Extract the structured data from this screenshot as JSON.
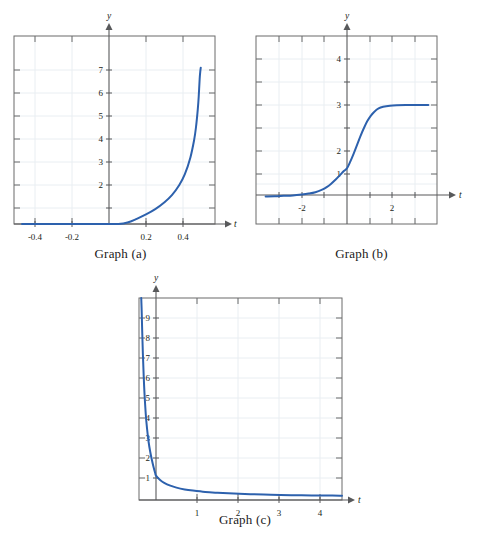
{
  "figure": {
    "title": "",
    "panels": [
      {
        "id": "a",
        "caption": "Graph (a)",
        "x_axis_name": "t",
        "y_axis_name": "y"
      },
      {
        "id": "b",
        "caption": "Graph (b)",
        "x_axis_name": "t",
        "y_axis_name": "y"
      },
      {
        "id": "c",
        "caption": "Graph (c)",
        "x_axis_name": "t",
        "y_axis_name": "y"
      }
    ]
  },
  "chart_data": [
    {
      "type": "line",
      "id": "a",
      "title": "Graph (a)",
      "xlabel": "t",
      "ylabel": "y",
      "xlim": [
        -0.47,
        0.5
      ],
      "ylim": [
        0,
        8.1
      ],
      "xticks": [
        -0.4,
        -0.2,
        0.2,
        0.4
      ],
      "xtick_labels": [
        "-0.4",
        "-0.2",
        "0.2",
        "0.4"
      ],
      "yticks": [
        2,
        3,
        4,
        5,
        6,
        7
      ],
      "ytick_labels": [
        "2",
        "3",
        "4",
        "5",
        "6",
        "7"
      ],
      "grid": true,
      "legend": "none",
      "series": [
        {
          "name": "curve-a",
          "color": "#2d61ad",
          "description": "increasing convex curve with vertical asymptote near t = 0.5",
          "x": [
            -0.47,
            -0.44,
            -0.4,
            -0.35,
            -0.3,
            -0.25,
            -0.2,
            -0.15,
            -0.1,
            -0.05,
            0.0,
            0.05,
            0.1,
            0.15,
            0.2,
            0.25,
            0.3,
            0.34,
            0.38,
            0.41,
            0.44,
            0.46,
            0.47,
            0.48,
            0.485,
            0.49,
            0.493,
            0.496
          ],
          "y": [
            0.52,
            0.54,
            0.57,
            0.61,
            0.66,
            0.71,
            0.77,
            0.84,
            0.92,
            1.01,
            1.11,
            1.23,
            1.37,
            1.53,
            1.72,
            1.95,
            2.25,
            2.56,
            3.0,
            3.47,
            4.2,
            4.95,
            5.5,
            6.3,
            6.85,
            7.6,
            7.9,
            8.1
          ]
        }
      ]
    },
    {
      "type": "line",
      "id": "b",
      "title": "Graph (b)",
      "xlabel": "t",
      "ylabel": "y",
      "xlim": [
        -3.6,
        3.6
      ],
      "ylim": [
        -0.45,
        4.55
      ],
      "xticks": [
        -2,
        2
      ],
      "xtick_labels": [
        "-2",
        "2"
      ],
      "yticks": [
        1,
        2,
        3,
        4
      ],
      "ytick_labels": [
        "1",
        "2",
        "3",
        "4"
      ],
      "grid": true,
      "legend": "none",
      "series": [
        {
          "name": "curve-b",
          "color": "#2d61ad",
          "description": "logistic S-curve rising from 0 to plateau at y = 4, passing y = 1 near t = 0",
          "x": [
            -3.6,
            -3.2,
            -2.8,
            -2.4,
            -2.0,
            -1.7,
            -1.4,
            -1.1,
            -0.9,
            -0.7,
            -0.5,
            -0.3,
            -0.15,
            0.0,
            0.15,
            0.3,
            0.45,
            0.6,
            0.75,
            0.9,
            1.05,
            1.2,
            1.4,
            1.6,
            1.9,
            2.2,
            2.6,
            3.0,
            3.4,
            3.6
          ],
          "y": [
            0.02,
            0.03,
            0.05,
            0.07,
            0.11,
            0.15,
            0.21,
            0.32,
            0.43,
            0.58,
            0.76,
            0.96,
            1.12,
            1.25,
            1.55,
            1.9,
            2.28,
            2.66,
            3.0,
            3.3,
            3.53,
            3.7,
            3.85,
            3.92,
            3.97,
            3.99,
            4.0,
            4.0,
            4.0,
            4.0
          ]
        }
      ]
    },
    {
      "type": "line",
      "id": "c",
      "title": "Graph (c)",
      "xlabel": "t",
      "ylabel": "y",
      "xlim": [
        -0.42,
        5.0
      ],
      "ylim": [
        -0.3,
        10.0
      ],
      "xticks": [
        1,
        2,
        3,
        4
      ],
      "xtick_labels": [
        "1",
        "2",
        "3",
        "4"
      ],
      "yticks": [
        1,
        2,
        3,
        4,
        5,
        6,
        7,
        8,
        9
      ],
      "ytick_labels": [
        "1",
        "2",
        "3",
        "4",
        "5",
        "6",
        "7",
        "8",
        "9"
      ],
      "grid": true,
      "legend": "none",
      "series": [
        {
          "name": "curve-c",
          "color": "#2d61ad",
          "description": "decaying curve with vertical asymptote left of the y-axis, falling through y = 1 at t = 0 toward 0",
          "x": [
            -0.36,
            -0.35,
            -0.34,
            -0.32,
            -0.3,
            -0.28,
            -0.25,
            -0.22,
            -0.18,
            -0.14,
            -0.1,
            -0.06,
            -0.02,
            0.0,
            0.1,
            0.2,
            0.35,
            0.5,
            0.7,
            0.9,
            1.2,
            1.5,
            1.9,
            2.3,
            2.8,
            3.3,
            3.8,
            4.3,
            4.8
          ],
          "y": [
            10.0,
            9.4,
            8.6,
            7.2,
            6.1,
            5.2,
            4.2,
            3.5,
            2.8,
            2.3,
            1.9,
            1.55,
            1.25,
            1.12,
            0.9,
            0.76,
            0.62,
            0.52,
            0.43,
            0.37,
            0.3,
            0.26,
            0.22,
            0.19,
            0.16,
            0.14,
            0.13,
            0.12,
            0.11
          ]
        }
      ]
    }
  ],
  "colors": {
    "curve": "#2d61ad",
    "frame": "#6b6b6b",
    "grid": "#e9eef2",
    "axis": "#58595b",
    "text": "#231f20",
    "background": "#ffffff"
  }
}
